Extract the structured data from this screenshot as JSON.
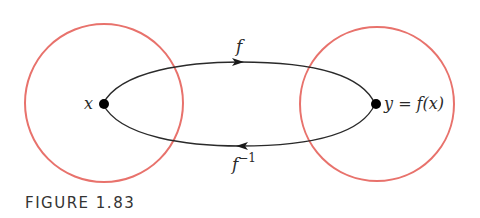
{
  "figure": {
    "caption": "FIGURE 1.83",
    "colors": {
      "circle": "#e8726c",
      "curve": "#2a2a2a",
      "point": "#000000",
      "caption": "#333333"
    },
    "domain_set": {
      "point_label": "x"
    },
    "codomain_set": {
      "point_label": "y = f(x)"
    },
    "forward_map": {
      "label": "f",
      "direction": "x to y"
    },
    "inverse_map": {
      "label_base": "f",
      "label_sup": "−1",
      "direction": "y to x"
    }
  }
}
